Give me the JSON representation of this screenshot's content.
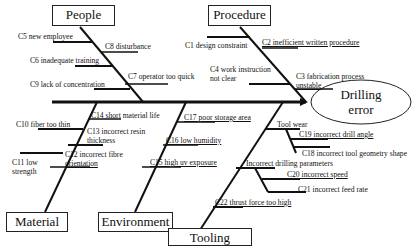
{
  "effect": {
    "line1": "Drilling",
    "line2": "error"
  },
  "categories": {
    "people": {
      "label": "People"
    },
    "procedure": {
      "label": "Procedure"
    },
    "material": {
      "label": "Material"
    },
    "environment": {
      "label": "Environment"
    },
    "tooling": {
      "label": "Tooling"
    }
  },
  "causes": {
    "c5": "C5 new employee",
    "c8": "C8 disturbance",
    "c6": "C6 inadequate training",
    "c7": "C7 operator too quick",
    "c9": "C9 lack of concentration",
    "c1": "C1 design constraint",
    "c2": "C2 inefficient written procedure",
    "c4a": "C4 work instruction",
    "c4b": "not clear",
    "c3a": "C3 fabrication process",
    "c3b": "unstable",
    "c14": "C14 short material life",
    "c10": "C10 fiber too thin",
    "c13a": "C13 incorrect resin",
    "c13b": "thickness",
    "c12a": "C12 incorrect fibre",
    "c12b": "orientation",
    "c11a": "C11 low",
    "c11b": "strength",
    "c17": "C17 poor storage area",
    "c16": "C16 low humidity",
    "c15": "C15 high uv exposure",
    "tool_wear": "Tool wear",
    "c19": "C19 incorrect drill angle",
    "c18": "C18 incorrect tool geometry shape",
    "drilling_params": "Incorrect drilling parameters",
    "c20": "C20 incorrect speed",
    "c21": "C21 incorrect feed rate",
    "c22": "C22 thrust force too high"
  }
}
